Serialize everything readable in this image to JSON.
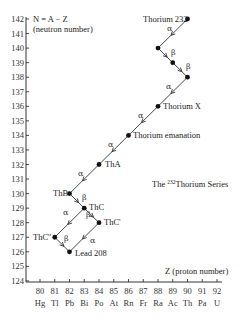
{
  "title": "The 232Thorium Series",
  "title_parts": {
    "prefix": "The ",
    "superscript": "232",
    "suffix": "Thorium Series"
  },
  "y_axis": {
    "label_line1": "N = A − Z",
    "label_line2": "(neutron number)",
    "ticks": [
      142,
      141,
      140,
      139,
      138,
      137,
      136,
      135,
      134,
      133,
      132,
      131,
      130,
      129,
      128,
      127,
      126,
      125,
      124
    ]
  },
  "x_axis": {
    "label": "Z (proton number)",
    "ticks": [
      80,
      81,
      82,
      83,
      84,
      85,
      86,
      87,
      88,
      89,
      90,
      91,
      92
    ],
    "elements": [
      "Hg",
      "Tl",
      "Pb",
      "Bi",
      "Po",
      "At",
      "Rn",
      "Fr",
      "Ra",
      "Ac",
      "Th",
      "Pa",
      "U"
    ]
  },
  "chart_data": {
    "type": "scatter",
    "title": "The 232Thorium Series",
    "xlabel": "Z (proton number)",
    "ylabel": "N = A − Z (neutron number)",
    "xlim": [
      80,
      92
    ],
    "ylim": [
      124,
      142
    ],
    "points": [
      {
        "name": "Thorium 232",
        "z": 90,
        "n": 142
      },
      {
        "name": "",
        "z": 88,
        "n": 140
      },
      {
        "name": "",
        "z": 89,
        "n": 139
      },
      {
        "name": "",
        "z": 90,
        "n": 138
      },
      {
        "name": "Thorium X",
        "z": 88,
        "n": 136
      },
      {
        "name": "Thorium emanation",
        "z": 86,
        "n": 134
      },
      {
        "name": "ThA",
        "z": 84,
        "n": 132
      },
      {
        "name": "ThB",
        "z": 82,
        "n": 130
      },
      {
        "name": "ThC",
        "z": 83,
        "n": 129
      },
      {
        "name": "ThC'",
        "z": 84,
        "n": 128
      },
      {
        "name": "ThC''",
        "z": 81,
        "n": 127
      },
      {
        "name": "Lead 208",
        "z": 82,
        "n": 126
      }
    ],
    "transitions": [
      {
        "from": [
          90,
          142
        ],
        "to": [
          88,
          140
        ],
        "type": "α"
      },
      {
        "from": [
          88,
          140
        ],
        "to": [
          89,
          139
        ],
        "type": "β"
      },
      {
        "from": [
          89,
          139
        ],
        "to": [
          90,
          138
        ],
        "type": "β"
      },
      {
        "from": [
          90,
          138
        ],
        "to": [
          88,
          136
        ],
        "type": "α"
      },
      {
        "from": [
          88,
          136
        ],
        "to": [
          86,
          134
        ],
        "type": "α"
      },
      {
        "from": [
          86,
          134
        ],
        "to": [
          84,
          132
        ],
        "type": "α"
      },
      {
        "from": [
          84,
          132
        ],
        "to": [
          82,
          130
        ],
        "type": "α"
      },
      {
        "from": [
          82,
          130
        ],
        "to": [
          83,
          129
        ],
        "type": "β"
      },
      {
        "from": [
          83,
          129
        ],
        "to": [
          84,
          128
        ],
        "type": "β"
      },
      {
        "from": [
          83,
          129
        ],
        "to": [
          81,
          127
        ],
        "type": "α"
      },
      {
        "from": [
          84,
          128
        ],
        "to": [
          82,
          126
        ],
        "type": "α"
      },
      {
        "from": [
          81,
          127
        ],
        "to": [
          82,
          126
        ],
        "type": "β"
      }
    ]
  },
  "labels": {
    "thorium232": "Thorium 232",
    "thoriumX": "Thorium X",
    "emanation": "Thorium emanation",
    "thA": "ThA",
    "thB": "ThB",
    "thC": "ThC",
    "thCp": "ThC'",
    "thCpp": "ThC''",
    "lead208": "Lead 208",
    "alpha": "α",
    "beta": "β"
  }
}
